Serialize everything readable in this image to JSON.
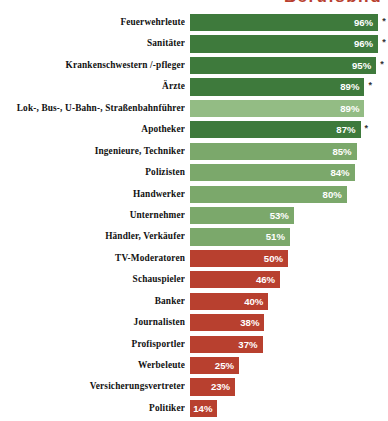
{
  "title": {
    "text": "Berufsbild",
    "color": "#B8402F",
    "clipped": true
  },
  "colors": {
    "green_dark": "#3E7A3C",
    "green_mid": "#7BA86B",
    "green_light": "#93BC84",
    "red": "#B8402F",
    "value_text": "#FFFFFF",
    "label_text": "#111111",
    "background": "#FFFFFF"
  },
  "chart_data": {
    "type": "bar",
    "orientation": "horizontal",
    "title": "Berufsbild",
    "xlabel": "",
    "ylabel": "",
    "xlim": [
      0,
      100
    ],
    "grid": false,
    "legend": false,
    "value_suffix": "%",
    "footnote_marker": "*",
    "categories": [
      "Feuerwehrleute",
      "Sanitäter",
      "Krankenschwestern /-pfleger",
      "Ärzte",
      "Lok-, Bus-, U-Bahn-, Straßenbahnführer",
      "Apotheker",
      "Ingenieure, Techniker",
      "Polizisten",
      "Handwerker",
      "Unternehmer",
      "Händler, Verkäufer",
      "TV-Moderatoren",
      "Schauspieler",
      "Banker",
      "Journalisten",
      "Profisportler",
      "Werbeleute",
      "Versicherungsvertreter",
      "Politiker"
    ],
    "values": [
      96,
      96,
      95,
      89,
      89,
      87,
      85,
      84,
      80,
      53,
      51,
      50,
      46,
      40,
      38,
      37,
      25,
      23,
      14
    ],
    "value_labels": [
      "96%",
      "96%",
      "95%",
      "89%",
      "89%",
      "87%",
      "85%",
      "84%",
      "80%",
      "53%",
      "51%",
      "50%",
      "46%",
      "40%",
      "38%",
      "37%",
      "25%",
      "23%",
      "14%"
    ],
    "bar_colors": [
      "#3E7A3C",
      "#3E7A3C",
      "#3E7A3C",
      "#3E7A3C",
      "#93BC84",
      "#3E7A3C",
      "#7BA86B",
      "#7BA86B",
      "#7BA86B",
      "#7BA86B",
      "#7BA86B",
      "#B8402F",
      "#B8402F",
      "#B8402F",
      "#B8402F",
      "#B8402F",
      "#B8402F",
      "#B8402F",
      "#B8402F"
    ],
    "starred": [
      true,
      true,
      true,
      true,
      false,
      true,
      false,
      false,
      false,
      false,
      false,
      false,
      false,
      false,
      false,
      false,
      false,
      false,
      false
    ]
  }
}
